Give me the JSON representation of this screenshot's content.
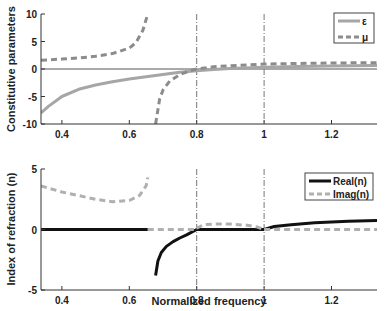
{
  "figure": {
    "width": 387,
    "height": 311,
    "shared_xlabel": "Normalized frequency"
  },
  "chart_data": [
    {
      "type": "line",
      "title": "",
      "xlabel": "",
      "ylabel": "Constitutive parameters",
      "xlim": [
        0.338,
        1.335
      ],
      "ylim": [
        -10,
        10
      ],
      "xticks": [
        0.4,
        0.6,
        0.8,
        1,
        1.2
      ],
      "xtick_labels": [
        "0.4",
        "0.6",
        "0.8",
        "1",
        "1.2"
      ],
      "yticks": [
        -10,
        -5,
        0,
        5,
        10
      ],
      "ytick_labels": [
        "-10",
        "-5",
        "0",
        "5",
        "10"
      ],
      "grid": false,
      "vlines": [
        0.8,
        1.0
      ],
      "hlines": [
        0
      ],
      "legend_position": "upper right",
      "series": [
        {
          "name": "ε",
          "style": "solid",
          "color": "#a6a6a6",
          "width": 3,
          "x": [
            0.338,
            0.36,
            0.4,
            0.45,
            0.5,
            0.55,
            0.6,
            0.65,
            0.7,
            0.75,
            0.8,
            0.85,
            0.9,
            1.0,
            1.1,
            1.2,
            1.335
          ],
          "y": [
            -8.0,
            -6.8,
            -5.0,
            -3.7,
            -2.9,
            -2.3,
            -1.8,
            -1.4,
            -1.0,
            -0.6,
            -0.3,
            -0.1,
            0.1,
            0.3,
            0.45,
            0.55,
            0.65
          ]
        },
        {
          "name": "μ",
          "style": "dashed",
          "color": "#8c8c8c",
          "width": 3,
          "segments": [
            {
              "x": [
                0.338,
                0.4,
                0.45,
                0.5,
                0.55,
                0.6,
                0.62,
                0.64,
                0.655
              ],
              "y": [
                1.6,
                1.8,
                2.0,
                2.3,
                2.8,
                3.8,
                4.8,
                7.0,
                10.0
              ]
            },
            {
              "x": [
                0.678,
                0.69,
                0.7,
                0.72,
                0.75,
                0.78,
                0.8,
                0.85,
                0.9,
                1.0,
                1.1,
                1.2,
                1.335
              ],
              "y": [
                -10.0,
                -5.5,
                -3.8,
                -2.2,
                -1.0,
                -0.3,
                0.0,
                0.4,
                0.6,
                0.9,
                1.0,
                1.1,
                1.15
              ]
            }
          ]
        }
      ]
    },
    {
      "type": "line",
      "title": "",
      "xlabel": "Normalized frequency",
      "ylabel": "Index of refraction (n)",
      "xlim": [
        0.338,
        1.335
      ],
      "ylim": [
        -5,
        5
      ],
      "xticks": [
        0.4,
        0.6,
        0.8,
        1,
        1.2
      ],
      "xtick_labels": [
        "0.4",
        "0.6",
        "0.8",
        "1",
        "1.2"
      ],
      "yticks": [
        -5,
        0,
        5
      ],
      "ytick_labels": [
        "-5",
        "0",
        "5"
      ],
      "grid": false,
      "vlines": [
        0.8,
        1.0
      ],
      "legend_position": "upper right",
      "series": [
        {
          "name": "Real(n)",
          "style": "solid",
          "color": "#111111",
          "width": 3,
          "segments": [
            {
              "x": [
                0.338,
                0.655
              ],
              "y": [
                0.0,
                0.0
              ]
            },
            {
              "x": [
                0.678,
                0.685,
                0.695,
                0.71,
                0.73,
                0.75,
                0.77,
                0.8
              ],
              "y": [
                -3.8,
                -2.6,
                -1.9,
                -1.4,
                -1.0,
                -0.7,
                -0.45,
                0.0
              ]
            },
            {
              "x": [
                0.8,
                1.0
              ],
              "y": [
                0.0,
                0.0
              ]
            },
            {
              "x": [
                1.0,
                1.03,
                1.08,
                1.15,
                1.2,
                1.25,
                1.335
              ],
              "y": [
                0.0,
                0.25,
                0.4,
                0.55,
                0.62,
                0.68,
                0.75
              ]
            }
          ]
        },
        {
          "name": "Imag(n)",
          "style": "dashed",
          "color": "#b0b0b0",
          "width": 3,
          "segments": [
            {
              "x": [
                0.338,
                0.4,
                0.45,
                0.5,
                0.55,
                0.6,
                0.63,
                0.65,
                0.655
              ],
              "y": [
                3.6,
                3.1,
                2.8,
                2.5,
                2.3,
                2.4,
                2.8,
                3.6,
                4.3
              ]
            },
            {
              "x": [
                0.655,
                0.8
              ],
              "y": [
                0.0,
                0.0
              ]
            },
            {
              "x": [
                0.8,
                0.82,
                0.85,
                0.9,
                0.95,
                0.98,
                1.0
              ],
              "y": [
                0.1,
                0.4,
                0.45,
                0.45,
                0.35,
                0.2,
                0.0
              ]
            },
            {
              "x": [
                1.0,
                1.335
              ],
              "y": [
                0.0,
                0.0
              ]
            }
          ]
        }
      ]
    }
  ]
}
